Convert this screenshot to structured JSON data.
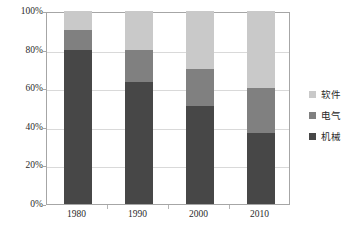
{
  "chart_data": {
    "type": "bar",
    "subtype": "stacked-100-percent",
    "title": "",
    "xlabel": "",
    "ylabel": "",
    "categories": [
      "1980",
      "1990",
      "2000",
      "2010"
    ],
    "ylim": [
      0,
      100
    ],
    "y_ticks": [
      0,
      20,
      40,
      60,
      80,
      100
    ],
    "y_tick_labels": [
      "0%",
      "20%",
      "40%",
      "60%",
      "80%",
      "100%"
    ],
    "grid": true,
    "grid_axis": "y",
    "legend_position": "right",
    "series": [
      {
        "name": "软件",
        "color": "#c9c9c9",
        "values": [
          10,
          20,
          30,
          40
        ]
      },
      {
        "name": "电气",
        "color": "#808080",
        "values": [
          10,
          17,
          19,
          23
        ]
      },
      {
        "name": "机械",
        "color": "#474747",
        "values": [
          80,
          63,
          51,
          37
        ]
      }
    ],
    "stack_order_bottom_to_top": [
      "机械",
      "电气",
      "软件"
    ],
    "colors": {
      "software": "#c9c9c9",
      "electrical": "#808080",
      "mechanical": "#474747",
      "gridline": "#d9d9d9",
      "frame": "#a6a6a6",
      "text": "#2b2b2b",
      "background": "#ffffff"
    }
  },
  "legend": {
    "items": [
      {
        "label": "软件",
        "color": "#c9c9c9"
      },
      {
        "label": "电气",
        "color": "#808080"
      },
      {
        "label": "机械",
        "color": "#474747"
      }
    ]
  }
}
